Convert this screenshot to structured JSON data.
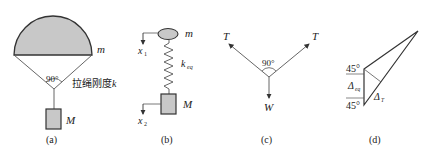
{
  "colors": {
    "fill": "#c8c8c8",
    "stroke": "#333333",
    "line": "#555555",
    "text": "#222222"
  },
  "panels": [
    {
      "id": "a",
      "caption": "(a)",
      "labels": {
        "canopy_mass": "m",
        "angle": "90°",
        "rope_stiffness": "拉绳刚度",
        "rope_k": "k",
        "load_mass": "M"
      }
    },
    {
      "id": "b",
      "caption": "(b)",
      "labels": {
        "top_mass": "m",
        "x1": "x",
        "x1_sub": "1",
        "spring": "k",
        "spring_sub": "eq",
        "bottom_mass": "M",
        "x2": "x",
        "x2_sub": "2"
      }
    },
    {
      "id": "c",
      "caption": "(c)",
      "labels": {
        "tension_left": "T",
        "tension_right": "T",
        "angle": "90°",
        "weight": "W"
      }
    },
    {
      "id": "d",
      "caption": "(d)",
      "labels": {
        "angle_top": "45°",
        "angle_bottom": "45°",
        "delta_eq": "Δ",
        "delta_eq_sub": "eq",
        "delta_t": "Δ",
        "delta_t_sub": "T"
      }
    }
  ]
}
